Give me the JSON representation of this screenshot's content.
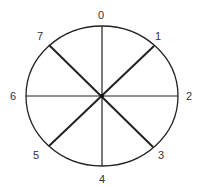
{
  "diagram": {
    "type": "circle-divided-into-8-sectors",
    "center": [
      102,
      96
    ],
    "radius_x": 76,
    "radius_y": 70,
    "stroke_color": "#222222",
    "labels": [
      {
        "text": "0",
        "x": 101,
        "y": 19
      },
      {
        "text": "1",
        "x": 158,
        "y": 40
      },
      {
        "text": "2",
        "x": 189,
        "y": 100
      },
      {
        "text": "3",
        "x": 161,
        "y": 159
      },
      {
        "text": "4",
        "x": 102,
        "y": 183
      },
      {
        "text": "5",
        "x": 36,
        "y": 159
      },
      {
        "text": "6",
        "x": 13,
        "y": 100
      },
      {
        "text": "7",
        "x": 40,
        "y": 40
      }
    ],
    "spokes": [
      {
        "name": "0-4",
        "x1": 102,
        "y1": 26,
        "x2": 102,
        "y2": 166,
        "width": 1.2
      },
      {
        "name": "6-2",
        "x1": 26,
        "y1": 96,
        "x2": 178,
        "y2": 96,
        "width": 1.2
      },
      {
        "name": "7-3",
        "x1": 49,
        "y1": 45,
        "x2": 153,
        "y2": 147,
        "width": 2
      },
      {
        "name": "1-5",
        "x1": 154,
        "y1": 46,
        "x2": 49,
        "y2": 146,
        "width": 2
      }
    ]
  }
}
